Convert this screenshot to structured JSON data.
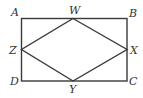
{
  "diagram": {
    "type": "geometry",
    "points": {
      "A": "A",
      "B": "B",
      "C": "C",
      "D": "D",
      "W": "W",
      "X": "X",
      "Y": "Y",
      "Z": "Z"
    },
    "rectangle": [
      "A",
      "B",
      "C",
      "D"
    ],
    "inner_quadrilateral": [
      "W",
      "X",
      "Y",
      "Z"
    ],
    "midpoints": {
      "W": "midpoint of AB",
      "X": "midpoint of BC",
      "Y": "midpoint of CD",
      "Z": "midpoint of DA"
    },
    "colors": {
      "line": "#3a3a3a",
      "label": "#333333",
      "background": "#ffffff"
    }
  }
}
